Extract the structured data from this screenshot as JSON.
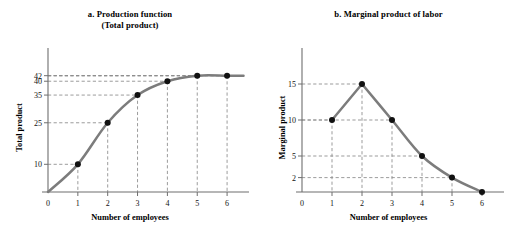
{
  "figure": {
    "panels": [
      {
        "id": "a",
        "title_line1": "a. Production function",
        "title_line2": "(Total product)",
        "xlabel": "Number of employees",
        "ylabel": "Total product"
      },
      {
        "id": "b",
        "title_line1": "b. Marginal product of labor",
        "title_line2": "",
        "xlabel": "Number of employees",
        "ylabel": "Marginal product"
      }
    ]
  },
  "chart_data": [
    {
      "type": "line",
      "title": "a. Production function (Total product)",
      "xlabel": "Number of employees",
      "ylabel": "Total product",
      "x": [
        0,
        1,
        2,
        3,
        4,
        5,
        6
      ],
      "values": [
        0,
        10,
        25,
        35,
        40,
        42,
        42
      ],
      "marked_points": [
        {
          "x": 1,
          "y": 10
        },
        {
          "x": 2,
          "y": 25
        },
        {
          "x": 3,
          "y": 35
        },
        {
          "x": 4,
          "y": 40
        },
        {
          "x": 5,
          "y": 42
        },
        {
          "x": 6,
          "y": 42
        }
      ],
      "xticks": [
        0,
        1,
        2,
        3,
        4,
        5,
        6
      ],
      "xtick_labels": [
        "0",
        "1",
        "2",
        "3",
        "4",
        "5",
        "6"
      ],
      "yticks": [
        10,
        25,
        35,
        40,
        42
      ],
      "ytick_labels": [
        "10",
        "25",
        "35",
        "40",
        "42"
      ],
      "xlim": [
        0,
        6.6
      ],
      "ylim": [
        0,
        52
      ],
      "grid": false,
      "guides": "dashed drop-lines from each marked point to both axes",
      "legend": null,
      "series_color": "#7c7c7c",
      "point_color": "#111111"
    },
    {
      "type": "line",
      "title": "b. Marginal product of labor",
      "xlabel": "Number of employees",
      "ylabel": "Marginal product",
      "x": [
        1,
        2,
        3,
        4,
        5,
        6
      ],
      "values": [
        10,
        15,
        10,
        5,
        2,
        0
      ],
      "marked_points": [
        {
          "x": 1,
          "y": 10
        },
        {
          "x": 2,
          "y": 15
        },
        {
          "x": 3,
          "y": 10
        },
        {
          "x": 4,
          "y": 5
        },
        {
          "x": 5,
          "y": 2
        },
        {
          "x": 6,
          "y": 0
        }
      ],
      "xticks": [
        0,
        1,
        2,
        3,
        4,
        5,
        6
      ],
      "xtick_labels": [
        "0",
        "1",
        "2",
        "3",
        "4",
        "5",
        "6"
      ],
      "yticks": [
        2,
        5,
        10,
        15
      ],
      "ytick_labels": [
        "2",
        "5",
        "10",
        "15"
      ],
      "xlim": [
        0,
        6.6
      ],
      "ylim": [
        0,
        20
      ],
      "grid": false,
      "guides": "dashed drop-lines from each marked point to both axes",
      "legend": null,
      "series_color": "#7c7c7c",
      "point_color": "#111111"
    }
  ]
}
